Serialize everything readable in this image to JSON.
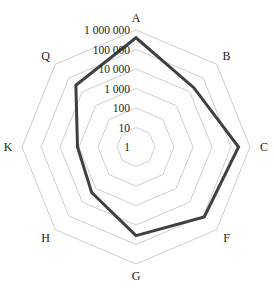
{
  "chart_data": {
    "type": "radar",
    "scale": "log10",
    "title": "",
    "axes": [
      "A",
      "B",
      "C",
      "F",
      "G",
      "H",
      "K",
      "Q"
    ],
    "rings": [
      1,
      10,
      100,
      1000,
      10000,
      100000,
      1000000
    ],
    "tick_labels": [
      "1",
      "10",
      "100",
      "1 000",
      "10 000",
      "100 000",
      "1 000 000"
    ],
    "range": [
      1,
      1000000
    ],
    "grid": true,
    "legend": "none",
    "series": [
      {
        "name": "series-1",
        "color": "#404040",
        "values": [
          400000,
          20000,
          250000,
          120000,
          35000,
          2000,
          1200,
          30000
        ]
      }
    ],
    "grid_color": "#c8c8c8"
  }
}
